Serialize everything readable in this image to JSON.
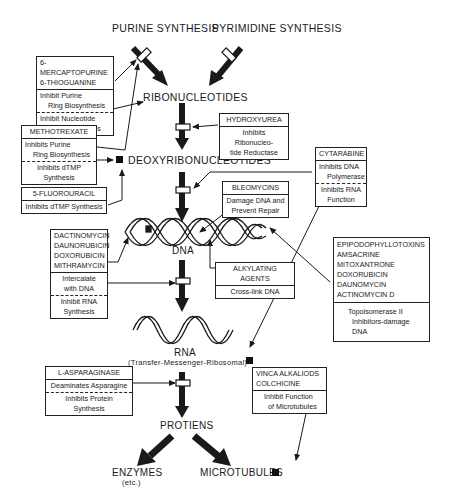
{
  "nodes": {
    "purine": [
      "PURINE",
      "SYNTHESIS"
    ],
    "pyrimidine": [
      "PYRIMIDINE",
      "SYNTHESIS"
    ],
    "ribonucleotides": "RIBONUCLEOTIDES",
    "deoxyribonucleotides": "DEOXYRIBONUCLEOTIDES",
    "dna": "DNA",
    "rna": "RNA",
    "rna_sub": "(Transfer-Messenger-Ribosomal)",
    "proteins": "PROTIENS",
    "enzymes": "ENZYMES",
    "enzymes_sub": "(etc.)",
    "microtubules": "MICROTUBULES"
  },
  "boxes": {
    "mercaptopurine": {
      "drugs": [
        "6-MERCAPTOPURINE",
        "6-THIOGUANINE"
      ],
      "action1": [
        "Inhibit Purine",
        "Ring Biosynthesis"
      ],
      "action2": [
        "Inhibit Nucleotide",
        "Interconversions"
      ]
    },
    "methotrexate": {
      "drugs": [
        "METHOTREXATE"
      ],
      "action1": [
        "Inhibits Purine",
        "Ring Biosynthesis"
      ],
      "action2": [
        "Inhibits dTMP",
        "Synthesis"
      ]
    },
    "fluorouracil": {
      "drugs": [
        "5-FLUOROURACIL"
      ],
      "action1": [
        "Inhibits dTMP Synthesis"
      ]
    },
    "hydroxyurea": {
      "drugs": [
        "HYDROXYUREA"
      ],
      "action1": [
        "Inhibits Ribonucleo-",
        "tide Reductase"
      ]
    },
    "cytarabine": {
      "drugs": [
        "CYTARABINE"
      ],
      "action1": [
        "Inhibits DNA",
        "Polymerase"
      ],
      "action2": [
        "Inhibits RNA",
        "Function"
      ]
    },
    "bleomycins": {
      "drugs": [
        "BLEOMYCINS"
      ],
      "action1": [
        "Damage DNA and",
        "Prevent Repair"
      ]
    },
    "dactinomycin": {
      "drugs": [
        "DACTINOMYCIN",
        "DAUNORUBICIN",
        "DOXORUBICIN",
        "MITHRAMYCIN"
      ],
      "action1": [
        "Intercalate",
        "with DNA"
      ],
      "action2": [
        "Inhibit RNA",
        "Synthesis"
      ]
    },
    "alkylating": {
      "drugs": [
        "ALKYLATING AGENTS"
      ],
      "action1": [
        "Cross-link DNA"
      ]
    },
    "epipodophyllotoxins": {
      "drugs": [
        "EPIPODOPHYLLOTOXINS",
        "AMSACRINE",
        "MITOXANTRONE",
        "DOXORUBICIN",
        "DAUNOMYCIN",
        "ACTINOMYCIN D"
      ],
      "action1": [
        "Topoisomerase II",
        "Inhibitors-damage",
        "DNA"
      ]
    },
    "asparaginase": {
      "drugs": [
        "L-ASPARAGINASE"
      ],
      "action1": [
        "Deaminates Asparagine"
      ],
      "action2": [
        "Inhibits Protein",
        "Synthesis"
      ]
    },
    "vinca": {
      "drugs": [
        "VINCA ALKALIODS",
        "COLCHICINE"
      ],
      "action1": [
        "Inhibit Function",
        "of Microtubules"
      ]
    }
  },
  "colors": {
    "ink": "#1a1a1a",
    "background": "#ffffff"
  }
}
